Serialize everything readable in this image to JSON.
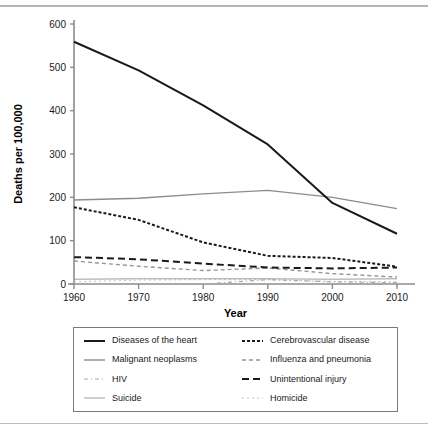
{
  "figure": {
    "has_top_rule": true,
    "has_bottom_rule": true,
    "rule_color": "#b4b4b4"
  },
  "chart_data": {
    "type": "line",
    "title": "",
    "xlabel": "Year",
    "ylabel": "Deaths per 100,000",
    "x": [
      1960,
      1970,
      1980,
      1990,
      2000,
      2010
    ],
    "xticklabels": [
      "1960",
      "1970",
      "1980",
      "1990",
      "2000",
      "2010"
    ],
    "xlim": [
      1960,
      2010
    ],
    "ylim": [
      0,
      600
    ],
    "yticks": [
      0,
      100,
      200,
      300,
      400,
      500,
      600
    ],
    "yticklabels": [
      "0",
      "100",
      "200",
      "300",
      "400",
      "500",
      "600"
    ],
    "grid": false,
    "legend_position": "below-axes",
    "legend_columns": 2,
    "series": [
      {
        "name": "Diseases of the heart",
        "values": [
          559,
          493,
          412,
          322,
          187,
          116
        ],
        "color": "#1a1a1a",
        "style": "solid",
        "width": 2.0
      },
      {
        "name": "Cerebrovascular disease",
        "values": [
          177,
          148,
          96,
          65,
          60,
          40
        ],
        "color": "#1a1a1a",
        "style": "dotted-fine",
        "width": 2.0
      },
      {
        "name": "Malignant neoplasms",
        "values": [
          194,
          198,
          208,
          216,
          200,
          174
        ],
        "color": "#8c8c8c",
        "style": "solid",
        "width": 1.4
      },
      {
        "name": "Influenza and pneumonia",
        "values": [
          53,
          41,
          31,
          37,
          24,
          16
        ],
        "color": "#969696",
        "style": "dashed-short",
        "width": 1.4
      },
      {
        "name": "HIV",
        "values": [
          0,
          0,
          0,
          10,
          5,
          3
        ],
        "color": "#a8a8a8",
        "style": "dash-dot",
        "width": 1.2
      },
      {
        "name": "Unintentional injury",
        "values": [
          62,
          57,
          47,
          38,
          36,
          38
        ],
        "color": "#1a1a1a",
        "style": "dashed-long",
        "width": 2.0
      },
      {
        "name": "Suicide",
        "values": [
          11,
          12,
          12,
          12,
          11,
          12
        ],
        "color": "#9e9e9e",
        "style": "solid",
        "width": 1.0
      },
      {
        "name": "Homicide",
        "values": [
          5,
          9,
          10,
          10,
          6,
          5
        ],
        "color": "#c4c4c4",
        "style": "dotted-light",
        "width": 1.0
      }
    ]
  },
  "legend": {
    "items": [
      {
        "label": "Diseases of the heart",
        "series": 0,
        "col": 0,
        "row": 0
      },
      {
        "label": "Cerebrovascular disease",
        "series": 1,
        "col": 1,
        "row": 0
      },
      {
        "label": "Malignant neoplasms",
        "series": 2,
        "col": 0,
        "row": 1
      },
      {
        "label": "Influenza and pneumonia",
        "series": 3,
        "col": 1,
        "row": 1
      },
      {
        "label": "HIV",
        "series": 4,
        "col": 0,
        "row": 2
      },
      {
        "label": "Unintentional injury",
        "series": 5,
        "col": 1,
        "row": 2
      },
      {
        "label": "Suicide",
        "series": 6,
        "col": 0,
        "row": 3
      },
      {
        "label": "Homicide",
        "series": 7,
        "col": 1,
        "row": 3
      }
    ]
  },
  "axes": {
    "axis_color": "#8c8c8c",
    "tick_label_color": "#1a1a1a",
    "axis_title_color": "#000000"
  }
}
